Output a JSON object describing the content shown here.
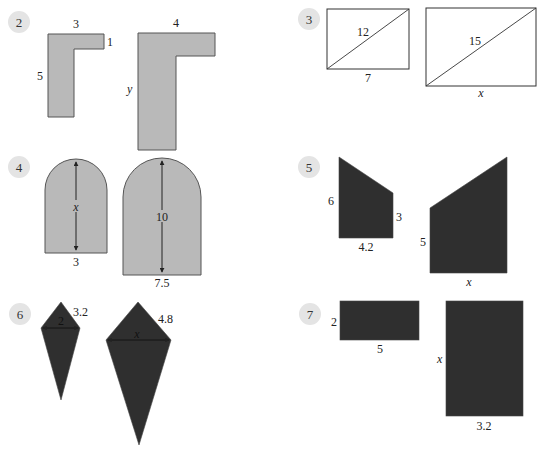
{
  "problems": [
    {
      "number": "2",
      "shape": "L-shape",
      "small": {
        "top": "3",
        "right_step": "1",
        "left": "5"
      },
      "large": {
        "top": "4",
        "left": "y"
      }
    },
    {
      "number": "3",
      "shape": "rectangle-with-diagonal",
      "small": {
        "diagonal": "12",
        "bottom": "7"
      },
      "large": {
        "diagonal": "15",
        "bottom": "x"
      }
    },
    {
      "number": "4",
      "shape": "arch",
      "small": {
        "height": "x",
        "bottom": "3"
      },
      "large": {
        "height": "10",
        "bottom": "7.5"
      }
    },
    {
      "number": "5",
      "shape": "right-trapezoid",
      "small": {
        "left": "6",
        "right": "3",
        "bottom": "4.2"
      },
      "large": {
        "left": "5",
        "bottom": "x"
      }
    },
    {
      "number": "6",
      "shape": "kite",
      "small": {
        "width": "2",
        "side": "3.2"
      },
      "large": {
        "width": "x",
        "side": "4.8"
      }
    },
    {
      "number": "7",
      "shape": "rectangle",
      "small": {
        "left": "2",
        "bottom": "5"
      },
      "large": {
        "left": "x",
        "bottom": "3.2"
      }
    }
  ],
  "colors": {
    "light_fill": "#b9b9b9",
    "dark_fill": "#2f2f2f",
    "badge": "#e4e4e4"
  }
}
